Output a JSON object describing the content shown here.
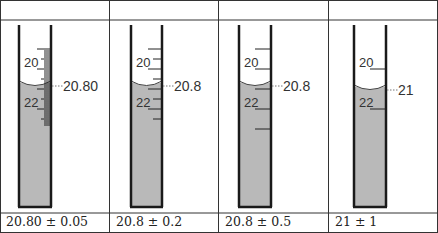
{
  "table": {
    "header_row": [
      "",
      "",
      "",
      ""
    ],
    "columns_x": [
      0,
      109,
      218,
      328,
      438
    ],
    "border_color": "#333333"
  },
  "cylinders": [
    {
      "id": "cylinder-1",
      "left_wall_x": 19,
      "right_wall_x": 51,
      "reading_label": "20.80",
      "reading_value": 20.8,
      "scale_labels": [
        {
          "text": "20",
          "value": 20
        },
        {
          "text": "22",
          "value": 22
        }
      ],
      "tick_interval": 0.1,
      "tick_start": 19.0,
      "tick_end": 22.8,
      "caption": "20.80 ± 0.05"
    },
    {
      "id": "cylinder-2",
      "left_wall_x": 131,
      "right_wall_x": 162,
      "reading_label": "20.8",
      "reading_value": 20.8,
      "scale_labels": [
        {
          "text": "20",
          "value": 20
        },
        {
          "text": "22",
          "value": 22
        }
      ],
      "tick_interval": 0.5,
      "tick_start": 19.0,
      "tick_end": 22.5,
      "caption": "20.8 ± 0.2"
    },
    {
      "id": "cylinder-3",
      "left_wall_x": 239,
      "right_wall_x": 271,
      "reading_label": "20.8",
      "reading_value": 20.8,
      "scale_labels": [
        {
          "text": "20",
          "value": 20
        },
        {
          "text": "22",
          "value": 22
        }
      ],
      "tick_interval": 1,
      "tick_start": 19,
      "tick_end": 23,
      "caption": "20.8 ± 0.5"
    },
    {
      "id": "cylinder-4",
      "left_wall_x": 354,
      "right_wall_x": 386,
      "reading_label": "21",
      "reading_value": 21,
      "scale_labels": [
        {
          "text": "20",
          "value": 20
        },
        {
          "text": "22",
          "value": 22
        }
      ],
      "tick_interval": 2,
      "tick_start": 20,
      "tick_end": 22,
      "caption": "21 ± 1"
    }
  ],
  "colors": {
    "liquid": "#b9b9b9",
    "glass": "#1a1a1a",
    "text": "#333333"
  }
}
